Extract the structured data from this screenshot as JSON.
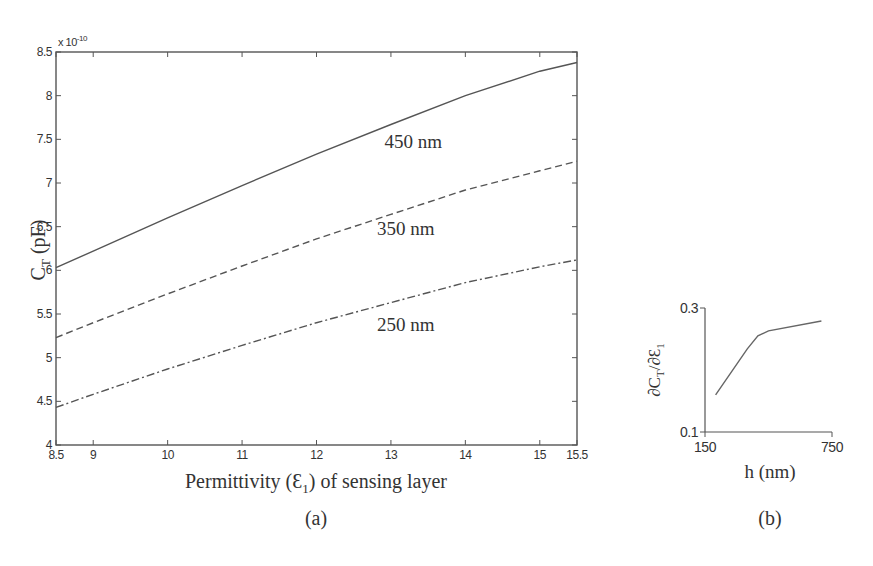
{
  "chart_data": [
    {
      "panel": "(a)",
      "type": "line",
      "title": "",
      "xlabel": "Permittivity (Ɛ1) of sensing layer",
      "ylabel": "CT (pF)",
      "y_multiplier": "x 10^-10",
      "xlim": [
        8.5,
        15.5
      ],
      "ylim": [
        4,
        8.5
      ],
      "xticks": [
        "8.5",
        "9",
        "10",
        "11",
        "12",
        "13",
        "14",
        "15",
        "15.5"
      ],
      "yticks": [
        "4",
        "4.5",
        "5",
        "5.5",
        "6",
        "6.5",
        "7",
        "7.5",
        "8",
        "8.5"
      ],
      "grid": false,
      "x": [
        8.5,
        9,
        10,
        11,
        12,
        13,
        14,
        15,
        15.5
      ],
      "series": [
        {
          "name": "450 nm",
          "style": "solid",
          "values": [
            6.03,
            6.22,
            6.6,
            6.97,
            7.33,
            7.67,
            8.0,
            8.28,
            8.38
          ]
        },
        {
          "name": "350 nm",
          "style": "dashed",
          "values": [
            5.23,
            5.4,
            5.73,
            6.05,
            6.36,
            6.64,
            6.92,
            7.14,
            7.25
          ]
        },
        {
          "name": "250 nm",
          "style": "dashdot",
          "values": [
            4.43,
            4.58,
            4.87,
            5.14,
            5.4,
            5.63,
            5.86,
            6.04,
            6.12
          ]
        }
      ],
      "annotations": [
        {
          "text": "450 nm",
          "x": 13.3,
          "y": 7.4
        },
        {
          "text": "350 nm",
          "x": 13.2,
          "y": 6.4
        },
        {
          "text": "250 nm",
          "x": 13.2,
          "y": 5.3
        }
      ]
    },
    {
      "panel": "(b)",
      "type": "line",
      "title": "",
      "xlabel": "h (nm)",
      "ylabel": "∂CT/∂Ɛ1",
      "xlim": [
        150,
        750
      ],
      "ylim": [
        0.1,
        0.3
      ],
      "xticks": [
        "150",
        "750"
      ],
      "yticks": [
        "0.1",
        "0.3"
      ],
      "grid": false,
      "x": [
        200,
        350,
        400,
        450,
        700
      ],
      "series": [
        {
          "name": "sensitivity",
          "style": "solid",
          "values": [
            0.16,
            0.234,
            0.255,
            0.263,
            0.279
          ]
        }
      ]
    }
  ],
  "labels": {
    "a": {
      "xlabel_main": "Permittivity (",
      "xlabel_eps": "Ɛ",
      "xlabel_sub": "1",
      "xlabel_rest": ") of sensing layer",
      "ylabel_c": "C",
      "ylabel_sub": "T",
      "ylabel_rest": " (pF)",
      "multiplier": "x 10",
      "multiplier_exp": "-10",
      "caption": "(a)"
    },
    "b": {
      "ylabel": "∂C",
      "ylabel_sub": "T",
      "ylabel_mid": "/∂Ɛ",
      "ylabel_sub2": "1",
      "xlabel": "h (nm)",
      "caption": "(b)"
    }
  }
}
